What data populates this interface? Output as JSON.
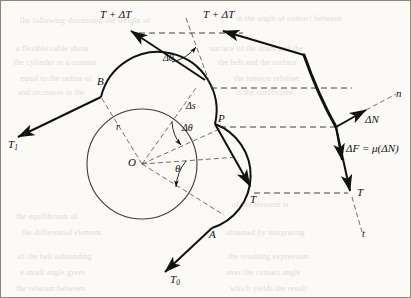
{
  "figure": {
    "colors": {
      "ink": "#111111",
      "background": "#fbfaf7",
      "dashed": "#2a2a2a",
      "bleed_text": "#b9b2a6"
    },
    "drum": {
      "center_label": "O",
      "radius_label": "r",
      "center_x": 142,
      "center_y": 164,
      "radius": 55
    },
    "points": [
      {
        "id": "B",
        "label": "B",
        "x": 101,
        "y": 97
      },
      {
        "id": "P",
        "label": "P",
        "x": 215,
        "y": 124
      },
      {
        "id": "A",
        "label": "A",
        "x": 212,
        "y": 228
      },
      {
        "id": "O",
        "label": "O",
        "x": 142,
        "y": 164
      }
    ],
    "angles": {
      "theta": "θ",
      "delta_theta": "Δθ",
      "delta_theta_top": "Δθ",
      "theta_value_deg": 36,
      "delta_theta_value_deg": 22
    },
    "arc_label": "Δs",
    "tensions": {
      "t1": "T",
      "t1_sub": "1",
      "t0": "T",
      "t0_sub": "0",
      "t": "T",
      "t_plus_dt": "T + ΔT"
    },
    "forces": {
      "normal": "ΔN",
      "friction": "ΔF = μ(ΔN)",
      "normal_axis": "n",
      "tangent_axis": "t"
    },
    "labels": {
      "t_plus_dt_left": "T + ΔT",
      "t_plus_dt_right": "T + ΔT",
      "t_center": "T",
      "t_right": "T"
    },
    "bleed_lines": [
      {
        "text": "the following discussion the weight of",
        "x": 20,
        "y": 16
      },
      {
        "text": "in the angle of contact between",
        "x": 236,
        "y": 14
      },
      {
        "text": "a flexible cable about",
        "x": 16,
        "y": 44
      },
      {
        "text": "surface of the drum and the",
        "x": 210,
        "y": 44
      },
      {
        "text": "the cylinder in a counter",
        "x": 14,
        "y": 58
      },
      {
        "text": "the belt and the surface",
        "x": 218,
        "y": 58
      },
      {
        "text": "equal to the radius of",
        "x": 20,
        "y": 74
      },
      {
        "text": "the tension relation",
        "x": 234,
        "y": 74
      },
      {
        "text": "and increases in the",
        "x": 18,
        "y": 88
      },
      {
        "text": "is the coefficient",
        "x": 236,
        "y": 88
      },
      {
        "text": "the equilibrium of",
        "x": 16,
        "y": 212
      },
      {
        "text": "of the element is",
        "x": 232,
        "y": 200
      },
      {
        "text": "the differential element",
        "x": 22,
        "y": 228
      },
      {
        "text": "obtained by integrating",
        "x": 226,
        "y": 228
      },
      {
        "text": "of the belt subtending",
        "x": 18,
        "y": 252
      },
      {
        "text": "the resulting expression",
        "x": 228,
        "y": 252
      },
      {
        "text": "a small angle gives",
        "x": 20,
        "y": 268
      },
      {
        "text": "over the contact angle",
        "x": 226,
        "y": 268
      },
      {
        "text": "the relation between",
        "x": 16,
        "y": 284
      },
      {
        "text": "which yields the result",
        "x": 230,
        "y": 284
      }
    ]
  }
}
